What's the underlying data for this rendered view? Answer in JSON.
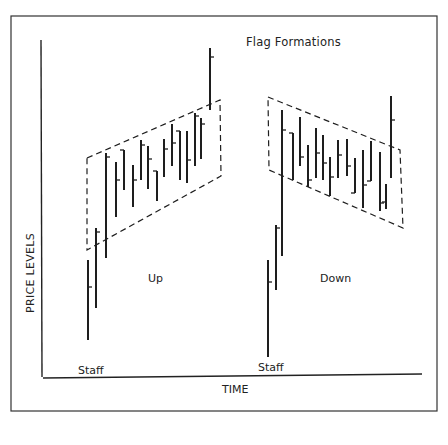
{
  "chart_data": {
    "type": "bar",
    "subtype": "ohlc-diagram",
    "title": "Flag Formations",
    "xlabel": "TIME",
    "ylabel": "PRICE LEVELS",
    "grid": false,
    "legend": null,
    "annotations": [
      "Up",
      "Down",
      "Staff",
      "Staff"
    ],
    "panels": [
      {
        "name": "Up",
        "description": "Upward staff followed by rising flag channel, breakout upward",
        "staff_label": "Staff",
        "bars": [
          {
            "x": 88,
            "high": 260,
            "low": 340,
            "close": 287
          },
          {
            "x": 96,
            "high": 228,
            "low": 308,
            "close": 232
          },
          {
            "x": 106,
            "high": 153,
            "low": 258,
            "close": 157
          },
          {
            "x": 116,
            "high": 162,
            "low": 217,
            "close": 180
          },
          {
            "x": 124,
            "high": 150,
            "low": 190,
            "close": 150,
            "open_left": true
          },
          {
            "x": 133,
            "high": 165,
            "low": 207,
            "close": 180
          },
          {
            "x": 141,
            "high": 140,
            "low": 180,
            "close": 145
          },
          {
            "x": 148,
            "high": 146,
            "low": 189,
            "close": 159
          },
          {
            "x": 157,
            "high": 171,
            "low": 201,
            "close": 171,
            "open_left": true
          },
          {
            "x": 164,
            "high": 139,
            "low": 177,
            "close": 149
          },
          {
            "x": 172,
            "high": 124,
            "low": 166,
            "close": 143
          },
          {
            "x": 180,
            "high": 131,
            "low": 180,
            "close": 131,
            "open_left": true
          },
          {
            "x": 187,
            "high": 131,
            "low": 183,
            "close": 160
          },
          {
            "x": 195,
            "high": 113,
            "low": 166,
            "close": 116
          },
          {
            "x": 201,
            "high": 118,
            "low": 159,
            "close": 124
          },
          {
            "x": 210,
            "high": 48,
            "low": 110,
            "close": 57
          }
        ],
        "flag_channel": [
          [
            87,
            158
          ],
          [
            220,
            100
          ],
          [
            221,
            176
          ],
          [
            87,
            250
          ]
        ]
      },
      {
        "name": "Down",
        "description": "Upward staff followed by declining flag channel, breakout upward",
        "staff_label": "Staff",
        "bars": [
          {
            "x": 268,
            "high": 260,
            "low": 357,
            "close": 282
          },
          {
            "x": 276,
            "high": 225,
            "low": 290,
            "close": 228
          },
          {
            "x": 282,
            "high": 110,
            "low": 256,
            "close": 130
          },
          {
            "x": 293,
            "high": 133,
            "low": 180,
            "close": 133,
            "open_left": true
          },
          {
            "x": 300,
            "high": 117,
            "low": 166,
            "close": 157
          },
          {
            "x": 308,
            "high": 145,
            "low": 187,
            "close": 180
          },
          {
            "x": 316,
            "high": 128,
            "low": 178,
            "close": 153
          },
          {
            "x": 323,
            "high": 135,
            "low": 180,
            "close": 163
          },
          {
            "x": 330,
            "high": 157,
            "low": 196,
            "close": 177
          },
          {
            "x": 338,
            "high": 140,
            "low": 178,
            "close": 155
          },
          {
            "x": 347,
            "high": 139,
            "low": 176,
            "close": 166
          },
          {
            "x": 355,
            "high": 158,
            "low": 193,
            "close": 193,
            "open_left": true
          },
          {
            "x": 363,
            "high": 150,
            "low": 208,
            "close": 185
          },
          {
            "x": 371,
            "high": 141,
            "low": 181,
            "close": 181,
            "open_left": true
          },
          {
            "x": 380,
            "high": 152,
            "low": 211,
            "close": 203
          },
          {
            "x": 386,
            "high": 184,
            "low": 209,
            "close": 202,
            "open_left": true
          },
          {
            "x": 391,
            "high": 96,
            "low": 178,
            "close": 120
          }
        ],
        "flag_channel": [
          [
            268,
            97
          ],
          [
            400,
            150
          ],
          [
            403,
            228
          ],
          [
            269,
            170
          ]
        ]
      }
    ]
  },
  "labels": {
    "title": "Flag Formations",
    "xlabel": "TIME",
    "ylabel": "PRICE LEVELS",
    "up": "Up",
    "down": "Down",
    "staff_left": "Staff",
    "staff_right": "Staff"
  },
  "colors": {
    "ink": "#1e1e1e",
    "background": "#ffffff"
  }
}
